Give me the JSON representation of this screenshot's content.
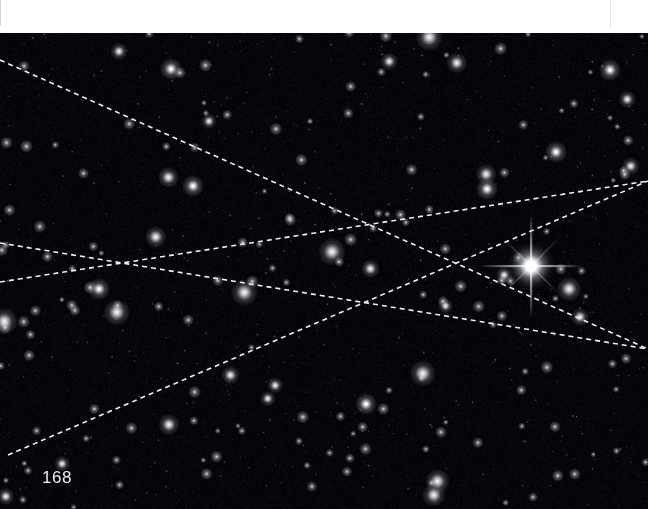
{
  "page": {
    "width": 648,
    "height": 509,
    "page_number": "168",
    "background_color": "#010103",
    "scan_margin_color": "#ffffff",
    "scan_margin_height": 33
  },
  "sky_plate": {
    "label": "star-field-photographic-plate",
    "top": 31,
    "height": 478,
    "sky_color": "#010103",
    "star_color": "#ffffff"
  },
  "annotations": {
    "line_color": "#f2f2f2",
    "line_style": "dashed",
    "dash_length": 5,
    "dash_gap": 4,
    "line_width": 1.6,
    "count": 4,
    "lines": [
      {
        "name": "trail-a",
        "x1": 0,
        "y1": 29,
        "x2": 648,
        "y2": 318
      },
      {
        "name": "trail-b",
        "x1": 0,
        "y1": 212,
        "x2": 648,
        "y2": 318
      },
      {
        "name": "trail-c",
        "x1": 0,
        "y1": 251,
        "x2": 648,
        "y2": 150
      },
      {
        "name": "trail-d",
        "x1": 8,
        "y1": 424,
        "x2": 648,
        "y2": 150
      }
    ],
    "intersections": [
      {
        "name": "crossing-left",
        "x": 131,
        "y": 263
      },
      {
        "name": "crossing-upper",
        "x": 443,
        "y": 213
      },
      {
        "name": "crossing-lower",
        "x": 440,
        "y": 315
      }
    ]
  },
  "bright_star": {
    "name": "bright-star-with-diffraction-spikes",
    "x": 531,
    "y": 266,
    "core_radius": 7,
    "spike_length": 46,
    "color": "#ffffff"
  },
  "stars": {
    "dense_field_count": 900,
    "medium_count": 150,
    "bright_count": 28,
    "notable_bright": [
      {
        "x": 171,
        "y": 69
      },
      {
        "x": 610,
        "y": 70
      },
      {
        "x": 556,
        "y": 152
      },
      {
        "x": 193,
        "y": 186
      },
      {
        "x": 487,
        "y": 189
      },
      {
        "x": 99,
        "y": 289
      },
      {
        "x": 366,
        "y": 404
      },
      {
        "x": 531,
        "y": 266
      }
    ]
  }
}
